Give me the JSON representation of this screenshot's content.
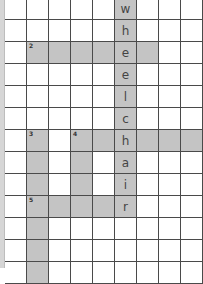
{
  "puzzle": {
    "cell_size": 22,
    "cols": 9,
    "rows": 13,
    "colors": {
      "shaded": "#c4c4c4",
      "grid_line": "#4a4a4a",
      "background": "#ffffff",
      "letter": "#444444"
    },
    "clue_numbers": [
      {
        "number": "1",
        "row": 0,
        "col": 5
      },
      {
        "number": "2",
        "row": 2,
        "col": 1
      },
      {
        "number": "3",
        "row": 6,
        "col": 1
      },
      {
        "number": "4",
        "row": 6,
        "col": 3
      },
      {
        "number": "5",
        "row": 9,
        "col": 1
      }
    ],
    "entries": [
      {
        "id": "1-down",
        "number": "1",
        "direction": "down",
        "row": 0,
        "col": 5,
        "length": 10,
        "answer": "wheelchair",
        "filled": "wheelchair"
      },
      {
        "id": "2-across",
        "number": "2",
        "direction": "across",
        "row": 2,
        "col": 1,
        "length": 6,
        "filled": "    e "
      },
      {
        "id": "3-down",
        "number": "3",
        "direction": "down",
        "row": 6,
        "col": 1,
        "length": 7,
        "filled": "       "
      },
      {
        "id": "4-down",
        "number": "4",
        "direction": "down",
        "row": 6,
        "col": 3,
        "length": 4,
        "filled": "    "
      },
      {
        "id": "4-across",
        "number": "4",
        "direction": "across",
        "row": 6,
        "col": 3,
        "length": 6,
        "filled": "  h   "
      },
      {
        "id": "5-across",
        "number": "5",
        "direction": "across",
        "row": 9,
        "col": 1,
        "length": 5,
        "filled": "    r"
      }
    ]
  }
}
